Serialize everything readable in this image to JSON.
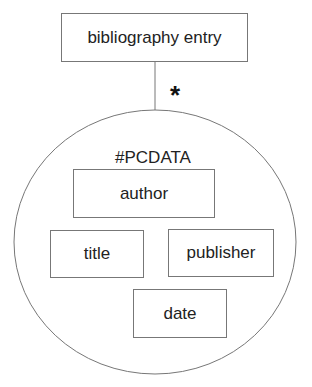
{
  "diagram": {
    "root": {
      "label": "bibliography entry"
    },
    "cardinality": "*",
    "group": {
      "label": "#PCDATA",
      "children": [
        {
          "label": "author"
        },
        {
          "label": "title"
        },
        {
          "label": "publisher"
        },
        {
          "label": "date"
        }
      ]
    }
  }
}
